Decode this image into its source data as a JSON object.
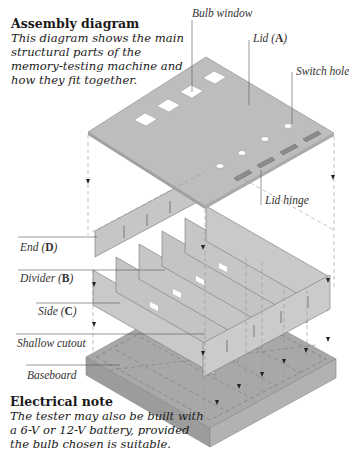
{
  "assembly_caption": {
    "title": "Assembly diagram",
    "body": "This diagram shows the main structural parts of the memory-testing machine and how they fit together."
  },
  "electrical_caption": {
    "title": "Electrical note",
    "body": "The tester may also be built with a 6-V or 12-V battery, provided the bulb chosen is suitable."
  },
  "labels": {
    "bulb_window": "Bulb window",
    "lid": {
      "text": "Lid (",
      "letter": "A",
      "close": ")"
    },
    "switch_hole": "Switch hole",
    "lid_hinge": "Lid hinge",
    "end": {
      "text": "End (",
      "letter": "D",
      "close": ")"
    },
    "divider": {
      "text": "Divider (",
      "letter": "B",
      "close": ")"
    },
    "side": {
      "text": "Side (",
      "letter": "C",
      "close": ")"
    },
    "shallow_cutout": "Shallow cutout",
    "baseboard": "Baseboard"
  },
  "parts": {
    "bulb_window_count": 4,
    "switch_hole_count": 4,
    "lid_hinge_count": 4,
    "divider_count": 4
  },
  "colors": {
    "panel_light": "#c8c8c8",
    "panel_mid": "#b4b4b4",
    "baseboard_top": "#a9a9a9",
    "baseboard_side": "#9a9a9a",
    "hinge": "#8a8a8a",
    "leader_line": "#555555",
    "dashed_line": "#999999"
  }
}
